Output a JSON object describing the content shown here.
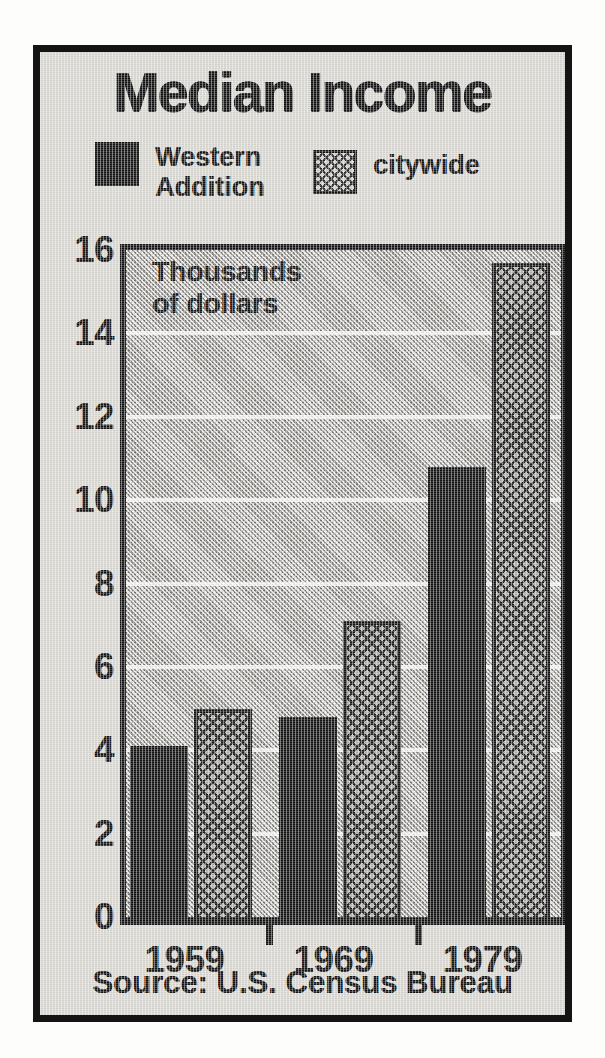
{
  "figure": {
    "title": "Median Income",
    "annotation": "Thousands\nof dollars",
    "source": "Source: U.S. Census Bureau"
  },
  "legend": {
    "items": [
      {
        "label": "Western\nAddition",
        "swatch": "solid-black-swatch",
        "color": "#121212"
      },
      {
        "label": "citywide",
        "swatch": "crosshatch-swatch",
        "color": "#b3b1ac"
      }
    ]
  },
  "colors": {
    "frame": "#141414",
    "paper": "#d9d7d2",
    "plot_background": "#b9b7b2",
    "gridline": "#ffffff",
    "ink": "#131313"
  },
  "chart_data": {
    "type": "bar",
    "title": "Median Income",
    "subtitle": "Thousands of dollars",
    "xlabel": "",
    "ylabel": "Thousands of dollars",
    "categories": [
      "1959",
      "1969",
      "1979"
    ],
    "series": [
      {
        "name": "Western Addition",
        "values": [
          4.1,
          4.8,
          10.8
        ]
      },
      {
        "name": "citywide",
        "values": [
          5.0,
          7.1,
          15.7
        ]
      }
    ],
    "ylim": [
      0,
      16
    ],
    "yticks": [
      0,
      2,
      4,
      6,
      8,
      10,
      12,
      14,
      16
    ],
    "ytick_labels": [
      "0",
      "2",
      "4",
      "6",
      "8",
      "10",
      "12",
      "14",
      "16"
    ],
    "grid": true,
    "grid_axis": "y",
    "legend_position": "above-plot",
    "source": "Source: U.S. Census Bureau"
  }
}
